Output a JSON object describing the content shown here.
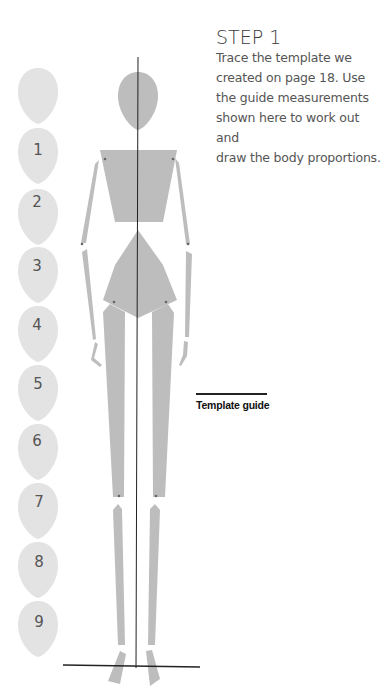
{
  "step": {
    "title": "STEP 1",
    "body_lines": [
      "Trace the template we",
      "created on page 18. Use",
      "the guide measurements",
      "shown here to work out and",
      "draw the body proportions."
    ]
  },
  "template_guide": {
    "label": "Template guide"
  },
  "head_units": {
    "labels": [
      "",
      "1",
      "2",
      "3",
      "4",
      "5",
      "6",
      "7",
      "8",
      "9"
    ],
    "count": 10
  },
  "colors": {
    "body_fill": "#bdbdbd",
    "head_unit_fill": "#e3e3e3",
    "line": "#222222",
    "text": "#555555"
  }
}
